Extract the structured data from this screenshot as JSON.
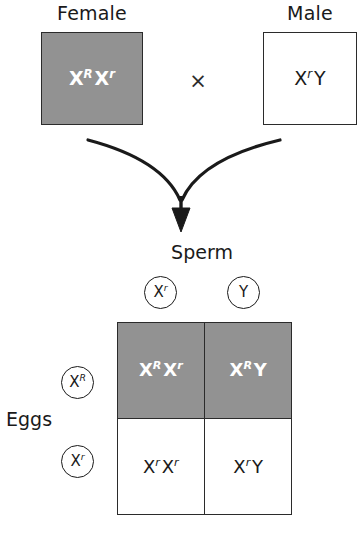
{
  "diagram": {
    "cross_symbol": "×",
    "colors": {
      "shaded_fill": "#929292",
      "unshaded_fill": "#ffffff",
      "stroke": "#2b2b2b",
      "text_on_shade": "#ffffff",
      "text_on_white": "#1a1a1a"
    }
  },
  "parents": {
    "female": {
      "label": "Female",
      "allele1": "X",
      "allele1_sup": "R",
      "allele2": "X",
      "allele2_sup": "r",
      "shaded": true
    },
    "male": {
      "label": "Male",
      "allele1": "X",
      "allele1_sup": "r",
      "allele2": "Y",
      "allele2_sup": "",
      "shaded": false
    }
  },
  "gametes": {
    "sperm": {
      "title": "Sperm",
      "items": [
        {
          "base": "X",
          "sup": "r"
        },
        {
          "base": "Y",
          "sup": ""
        }
      ]
    },
    "eggs": {
      "title": "Eggs",
      "items": [
        {
          "base": "X",
          "sup": "R"
        },
        {
          "base": "X",
          "sup": "r"
        }
      ]
    }
  },
  "punnett": {
    "cells": [
      {
        "row": 0,
        "col": 0,
        "shaded": true,
        "a1": "X",
        "a1_sup": "R",
        "a2": "X",
        "a2_sup": "r"
      },
      {
        "row": 0,
        "col": 1,
        "shaded": true,
        "a1": "X",
        "a1_sup": "R",
        "a2": "Y",
        "a2_sup": ""
      },
      {
        "row": 1,
        "col": 0,
        "shaded": false,
        "a1": "X",
        "a1_sup": "r",
        "a2": "X",
        "a2_sup": "r"
      },
      {
        "row": 1,
        "col": 1,
        "shaded": false,
        "a1": "X",
        "a1_sup": "r",
        "a2": "Y",
        "a2_sup": ""
      }
    ]
  }
}
